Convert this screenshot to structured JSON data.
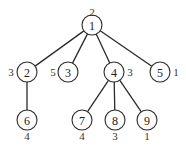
{
  "diagram": {
    "type": "tree",
    "node_radius": 10,
    "nodes": [
      {
        "id": "1",
        "label": "1",
        "x": 92,
        "y": 25,
        "weight": "2",
        "wx": 92,
        "wy": 12
      },
      {
        "id": "2",
        "label": "2",
        "x": 27,
        "y": 72,
        "weight": "3",
        "wx": 11,
        "wy": 72
      },
      {
        "id": "3",
        "label": "3",
        "x": 68,
        "y": 72,
        "weight": "5",
        "wx": 53,
        "wy": 72
      },
      {
        "id": "4",
        "label": "4",
        "x": 114,
        "y": 72,
        "weight": "3",
        "wx": 130,
        "wy": 72
      },
      {
        "id": "5",
        "label": "5",
        "x": 160,
        "y": 72,
        "weight": "1",
        "wx": 176,
        "wy": 72
      },
      {
        "id": "6",
        "label": "6",
        "x": 27,
        "y": 120,
        "weight": "4",
        "wx": 27,
        "wy": 136
      },
      {
        "id": "7",
        "label": "7",
        "x": 82,
        "y": 120,
        "weight": "4",
        "wx": 82,
        "wy": 136
      },
      {
        "id": "8",
        "label": "8",
        "x": 115,
        "y": 120,
        "weight": "3",
        "wx": 115,
        "wy": 136
      },
      {
        "id": "9",
        "label": "9",
        "x": 147,
        "y": 120,
        "weight": "1",
        "wx": 147,
        "wy": 136
      }
    ],
    "edges": [
      {
        "from": "1",
        "to": "2"
      },
      {
        "from": "1",
        "to": "3"
      },
      {
        "from": "1",
        "to": "4"
      },
      {
        "from": "1",
        "to": "5"
      },
      {
        "from": "2",
        "to": "6"
      },
      {
        "from": "4",
        "to": "7"
      },
      {
        "from": "4",
        "to": "8"
      },
      {
        "from": "4",
        "to": "9"
      }
    ]
  }
}
